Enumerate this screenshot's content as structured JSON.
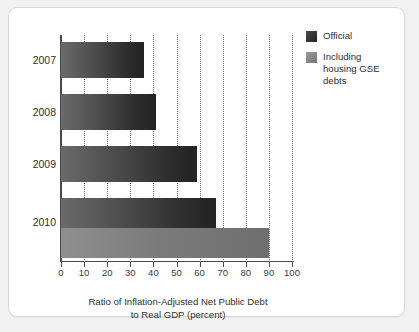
{
  "chart_data": {
    "type": "bar",
    "orientation": "horizontal",
    "title": "",
    "xlabel": "Ratio of Inflation-Adjusted Net Public Debt to Real GDP (percent)",
    "xlabel_line1": "Ratio of Inflation-Adjusted Net Public Debt",
    "xlabel_line2": "to Real GDP (percent)",
    "ylabel": "",
    "categories": [
      "2007",
      "2008",
      "2009",
      "2010"
    ],
    "xlim": [
      0,
      100
    ],
    "xticks": [
      0,
      10,
      20,
      30,
      40,
      50,
      60,
      70,
      80,
      90,
      100
    ],
    "xtick_labels": [
      "0",
      "10",
      "20",
      "30",
      "40",
      "50",
      "60",
      "70",
      "80",
      "90",
      "100"
    ],
    "grid": "vertical-dotted",
    "legend_position": "top-right",
    "series": [
      {
        "name": "Official",
        "color": "#2e2e2e",
        "values": [
          36,
          41,
          59,
          67
        ]
      },
      {
        "name": "Including housing GSE debts",
        "color": "#7b7b7b",
        "values": [
          null,
          null,
          null,
          90
        ]
      }
    ]
  },
  "legend": {
    "items": [
      {
        "label": "Official",
        "swatch": "dark-swatch"
      },
      {
        "label": "Including housing GSE debts",
        "swatch": "gray-swatch"
      }
    ],
    "item0_label": "Official",
    "item1_line1": "Including",
    "item1_line2": "housing GSE",
    "item1_line3": "debts"
  },
  "axis": {
    "x_tick_0": "0",
    "x_tick_1": "10",
    "x_tick_2": "20",
    "x_tick_3": "30",
    "x_tick_4": "40",
    "x_tick_5": "50",
    "x_tick_6": "60",
    "x_tick_7": "70",
    "x_tick_8": "80",
    "x_tick_9": "90",
    "x_tick_10": "100",
    "y_label_0": "2007",
    "y_label_1": "2008",
    "y_label_2": "2009",
    "y_label_3": "2010",
    "title_line1": "Ratio of Inflation-Adjusted Net Public Debt",
    "title_line2": "to Real GDP (percent)"
  },
  "colors": {
    "panel_background": "#ffffff",
    "page_background": "#f1f1f1",
    "axis": "#4a4a4a",
    "grid": "#6e6e6e",
    "official_bar": "#2e2e2e",
    "gse_bar": "#7b7b7b",
    "text": "#2f2f2f"
  }
}
